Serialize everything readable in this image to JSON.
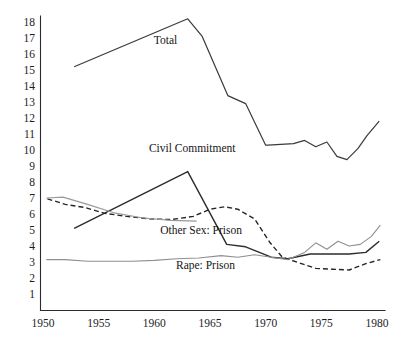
{
  "figure": {
    "cropped_header_text": "",
    "background_color": "#ffffff"
  },
  "axes": {
    "x_ticks": [
      "1950",
      "1955",
      "1960",
      "1965",
      "1970",
      "1975",
      "1980"
    ],
    "y_ticks": [
      "18",
      "17",
      "16",
      "15",
      "14",
      "13",
      "12",
      "11",
      "10",
      "9",
      "8",
      "7",
      "6",
      "5",
      "4",
      "3",
      "2",
      "1"
    ],
    "axis_color": "#2b2b2b"
  },
  "annotations": [
    {
      "id": "total",
      "text": "Total",
      "x": 1961.0,
      "y": 16.6
    },
    {
      "id": "civil-commitment",
      "text": "Civil Commitment",
      "x": 1963.4,
      "y": 9.9
    },
    {
      "id": "other-sex-prison",
      "text": "Other Sex: Prison",
      "x": 1964.2,
      "y": 4.75
    },
    {
      "id": "rape-prison",
      "text": "Rape: Prison",
      "x": 1964.6,
      "y": 2.55
    }
  ],
  "chart_data": {
    "type": "line",
    "title": "",
    "xlabel": "",
    "ylabel": "",
    "xlim": [
      1950,
      1981
    ],
    "ylim": [
      0.4,
      18.6
    ],
    "grid": false,
    "legend": "inline-annotations",
    "series": [
      {
        "name": "Total",
        "label": "Total",
        "color": "#3a3a3a",
        "width": 1.2,
        "dash": "none",
        "x": [
          1952.8,
          1963.0,
          1964.3,
          1966.6,
          1968.2,
          1970.0,
          1970.2,
          1972.5,
          1973.5,
          1974.5,
          1975.5,
          1976.4,
          1977.3,
          1978.3,
          1979.1,
          1980.2
        ],
        "y": [
          15.2,
          18.2,
          17.1,
          13.4,
          12.9,
          10.3,
          10.3,
          10.4,
          10.6,
          10.2,
          10.5,
          9.6,
          9.4,
          10.1,
          10.9,
          11.8
        ]
      },
      {
        "name": "Civil Commitment",
        "label": "Civil Commitment",
        "color": "#2c2c2c",
        "width": 1.4,
        "dash": "none",
        "x": [
          1952.8,
          1963.0,
          1966.5,
          1968.2,
          1970.5,
          1972.0,
          1974.0,
          1976.0,
          1977.5,
          1979.0,
          1980.2
        ],
        "y": [
          5.1,
          8.65,
          4.1,
          3.95,
          3.3,
          3.2,
          3.5,
          3.5,
          3.5,
          3.6,
          4.3
        ]
      },
      {
        "name": "Other Sex: Prison",
        "label": "Other Sex: Prison",
        "color": "#262626",
        "width": 1.4,
        "dash": "5,3",
        "x": [
          1950.4,
          1952.0,
          1953.8,
          1955.5,
          1957.5,
          1959.5,
          1961.5,
          1963.5,
          1965.0,
          1966.3,
          1967.5,
          1969.0,
          1970.4,
          1971.5,
          1973.0,
          1974.5,
          1976.0,
          1977.5,
          1979.0,
          1980.3
        ],
        "y": [
          6.95,
          6.6,
          6.4,
          6.05,
          5.85,
          5.7,
          5.65,
          5.85,
          6.3,
          6.45,
          6.3,
          5.7,
          4.2,
          3.3,
          2.95,
          2.6,
          2.55,
          2.5,
          2.9,
          3.15
        ]
      },
      {
        "name": "Rape: Prison",
        "label": "Rape: Prison",
        "color": "#8f8f8f",
        "width": 1.1,
        "dash": "none",
        "x": [
          1950.3,
          1952.0,
          1954.0,
          1956.0,
          1958.0,
          1960.0,
          1962.0,
          1964.0,
          1966.0,
          1967.5,
          1969.0,
          1970.5,
          1972.0,
          1973.5,
          1974.5,
          1975.5,
          1976.5,
          1977.5,
          1978.5,
          1979.5,
          1980.3
        ],
        "y": [
          3.15,
          3.15,
          3.05,
          3.05,
          3.05,
          3.1,
          3.2,
          3.25,
          3.4,
          3.3,
          3.45,
          3.3,
          3.15,
          3.6,
          4.2,
          3.8,
          4.3,
          4.0,
          4.1,
          4.6,
          5.3
        ]
      },
      {
        "name": "Other Sex: Prison (pre-1963 gray segment)",
        "label": "",
        "color": "#9a9a9a",
        "width": 1.2,
        "dash": "none",
        "x": [
          1950.3,
          1951.8,
          1954.0,
          1956.5,
          1959.0,
          1961.5,
          1963.8
        ],
        "y": [
          7.0,
          7.05,
          6.6,
          6.05,
          5.75,
          5.6,
          5.55
        ]
      }
    ]
  }
}
